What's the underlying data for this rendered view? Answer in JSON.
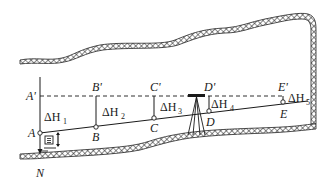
{
  "diagram": {
    "type": "tunnel-leveling-profile",
    "colors": {
      "ink": "#1a1a1a",
      "background": "#ffffff"
    },
    "points": [
      {
        "id": "A",
        "label": "A",
        "prime": "A'"
      },
      {
        "id": "B",
        "label": "B",
        "prime": "B'"
      },
      {
        "id": "C",
        "label": "C",
        "prime": "C'"
      },
      {
        "id": "D",
        "label": "D",
        "prime": "D'"
      },
      {
        "id": "E",
        "label": "E",
        "prime": "E'"
      }
    ],
    "height_diffs": [
      {
        "symbol": "ΔH",
        "sub": "1"
      },
      {
        "symbol": "ΔH",
        "sub": "2"
      },
      {
        "symbol": "ΔH",
        "sub": "3"
      },
      {
        "symbol": "ΔH",
        "sub": "4"
      },
      {
        "symbol": "ΔH",
        "sub": "5"
      }
    ],
    "bottom_label": "N",
    "instrument_label": "level-instrument-tripod",
    "reference_line": "dashed horizontal line of sight through A'–E'",
    "ground": "cross-hatched tunnel boundary (roof and floor)"
  }
}
